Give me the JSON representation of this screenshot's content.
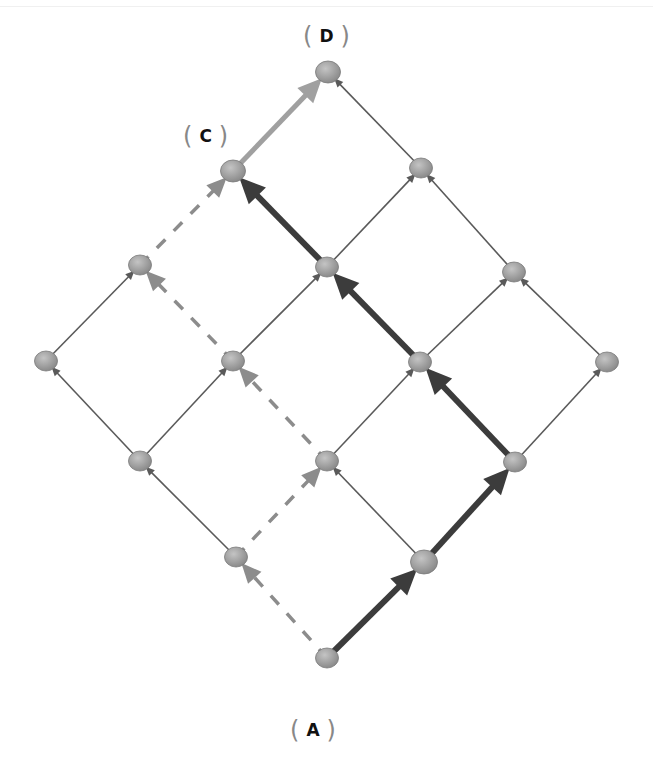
{
  "diagram": {
    "type": "lattice-path-graph",
    "colors": {
      "thin_edge": "#5a5a5a",
      "dashed_path": "#8c8c8c",
      "dark_path": "#3c3c3c",
      "final_edge": "#a0a0a0",
      "node_fill": "#9a9a9a",
      "node_stroke": "#7a7a7a",
      "label_text": "#111111",
      "bracket": "#888888"
    },
    "labels": [
      {
        "id": "A",
        "text": "A",
        "x": 290,
        "y": 716
      },
      {
        "id": "C",
        "text": "C",
        "x": 183,
        "y": 122
      },
      {
        "id": "D",
        "text": "D",
        "x": 303,
        "y": 22
      }
    ],
    "nodes": [
      {
        "id": "A",
        "x": 327,
        "y": 658,
        "r": 10
      },
      {
        "id": "n1",
        "x": 236,
        "y": 557,
        "r": 10
      },
      {
        "id": "n2",
        "x": 424,
        "y": 562,
        "r": 12
      },
      {
        "id": "n3",
        "x": 140,
        "y": 461,
        "r": 10
      },
      {
        "id": "n4",
        "x": 327,
        "y": 461,
        "r": 10
      },
      {
        "id": "n5",
        "x": 515,
        "y": 462,
        "r": 10
      },
      {
        "id": "n6",
        "x": 46,
        "y": 361,
        "r": 10
      },
      {
        "id": "n7",
        "x": 233,
        "y": 361,
        "r": 10
      },
      {
        "id": "n8",
        "x": 420,
        "y": 362,
        "r": 10
      },
      {
        "id": "n9",
        "x": 607,
        "y": 362,
        "r": 10
      },
      {
        "id": "n10",
        "x": 140,
        "y": 265,
        "r": 10
      },
      {
        "id": "n11",
        "x": 327,
        "y": 267,
        "r": 10
      },
      {
        "id": "n12",
        "x": 514,
        "y": 272,
        "r": 10
      },
      {
        "id": "C",
        "x": 233,
        "y": 171,
        "r": 11
      },
      {
        "id": "n14",
        "x": 421,
        "y": 168,
        "r": 10
      },
      {
        "id": "D",
        "x": 328,
        "y": 72,
        "r": 11
      }
    ],
    "edges": [
      {
        "from": "A",
        "to": "n1",
        "style": "dashed"
      },
      {
        "from": "A",
        "to": "n2",
        "style": "dark"
      },
      {
        "from": "n1",
        "to": "n3",
        "style": "thin"
      },
      {
        "from": "n1",
        "to": "n4",
        "style": "dashed"
      },
      {
        "from": "n2",
        "to": "n4",
        "style": "thin"
      },
      {
        "from": "n2",
        "to": "n5",
        "style": "dark"
      },
      {
        "from": "n3",
        "to": "n6",
        "style": "thin"
      },
      {
        "from": "n3",
        "to": "n7",
        "style": "thin"
      },
      {
        "from": "n4",
        "to": "n7",
        "style": "dashed"
      },
      {
        "from": "n4",
        "to": "n8",
        "style": "thin"
      },
      {
        "from": "n5",
        "to": "n8",
        "style": "dark"
      },
      {
        "from": "n5",
        "to": "n9",
        "style": "thin"
      },
      {
        "from": "n6",
        "to": "n10",
        "style": "thin"
      },
      {
        "from": "n7",
        "to": "n10",
        "style": "dashed"
      },
      {
        "from": "n7",
        "to": "n11",
        "style": "thin"
      },
      {
        "from": "n8",
        "to": "n11",
        "style": "dark"
      },
      {
        "from": "n8",
        "to": "n12",
        "style": "thin"
      },
      {
        "from": "n9",
        "to": "n12",
        "style": "thin"
      },
      {
        "from": "n10",
        "to": "C",
        "style": "dashed"
      },
      {
        "from": "n11",
        "to": "C",
        "style": "dark"
      },
      {
        "from": "n11",
        "to": "n14",
        "style": "thin"
      },
      {
        "from": "n12",
        "to": "n14",
        "style": "thin"
      },
      {
        "from": "C",
        "to": "D",
        "style": "final"
      },
      {
        "from": "n14",
        "to": "D",
        "style": "thin"
      }
    ]
  }
}
